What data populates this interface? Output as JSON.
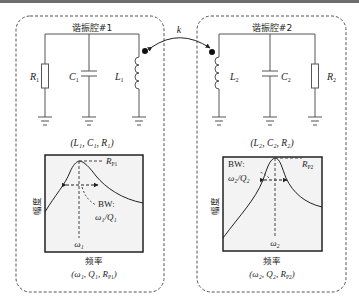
{
  "coupling": {
    "label": "k"
  },
  "cavity1": {
    "title": "谐振腔#1",
    "components": [
      {
        "symbol": "R",
        "sub": "1",
        "type": "resistor"
      },
      {
        "symbol": "C",
        "sub": "1",
        "type": "capacitor"
      },
      {
        "symbol": "L",
        "sub": "1",
        "type": "inductor"
      }
    ],
    "params_label": "(L₁, C₁, R₁)",
    "plot": {
      "ylabel": "幅度",
      "xlabel": "频率",
      "peak_label": "R",
      "peak_sub": "P1",
      "bw_label": "BW:",
      "bw_formula": "ω₁/Q₁",
      "center_label": "ω₁",
      "params_label": "(ω₁, Q₁, R_P1)",
      "params_text": "(ω₁, Q₁, R",
      "params_sub": "P1",
      "params_end": ")"
    }
  },
  "cavity2": {
    "title": "谐振腔#2",
    "components": [
      {
        "symbol": "L",
        "sub": "2",
        "type": "inductor"
      },
      {
        "symbol": "C",
        "sub": "2",
        "type": "capacitor"
      },
      {
        "symbol": "R",
        "sub": "2",
        "type": "resistor"
      }
    ],
    "params_label": "(L₂, C₂, R₂)",
    "plot": {
      "ylabel": "幅度",
      "xlabel": "频率",
      "peak_label": "R",
      "peak_sub": "P2",
      "bw_label": "BW:",
      "bw_formula": "ω₂/Q₂",
      "center_label": "ω₂",
      "params_text": "(ω₂, Q₂, R",
      "params_sub": "P2",
      "params_end": ")"
    }
  },
  "colors": {
    "line": "#2a2a2a",
    "wire": "#555555",
    "plot_bg": "#f3f3f3",
    "dash": "#555555"
  }
}
